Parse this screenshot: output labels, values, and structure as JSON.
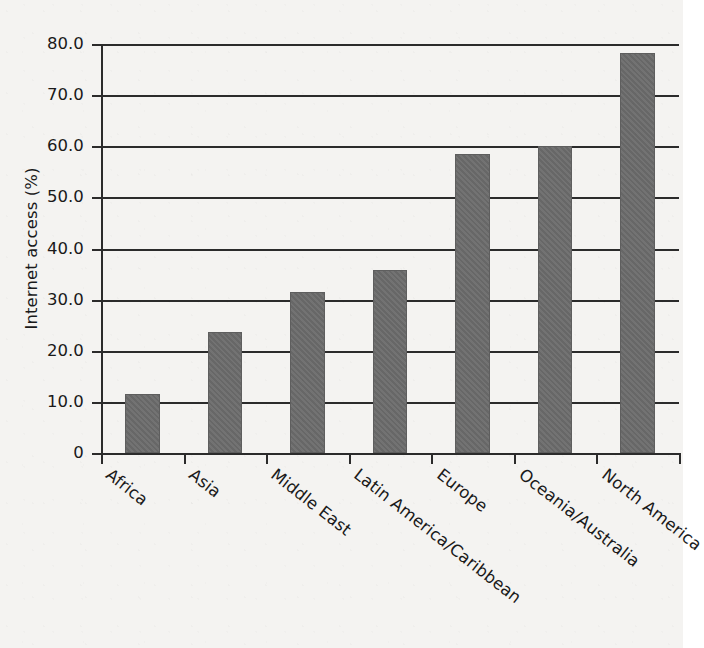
{
  "chart_data": {
    "type": "bar",
    "title": "",
    "xlabel": "",
    "ylabel": "Internet access (%)",
    "categories": [
      "Africa",
      "Asia",
      "Middle East",
      "Latin America/Caribbean",
      "Europe",
      "Oceania/Australia",
      "North America"
    ],
    "values": [
      11.5,
      23.7,
      31.5,
      35.8,
      58.5,
      60.0,
      78.3
    ],
    "ylim": [
      0,
      80
    ],
    "ytick_values": [
      0,
      10,
      20,
      30,
      40,
      50,
      60,
      70,
      80
    ],
    "ytick_labels": [
      "0",
      "10.0",
      "20.0",
      "30.0",
      "40.0",
      "50.0",
      "60.0",
      "70.0",
      "80.0"
    ],
    "grid": "horizontal",
    "legend": "none",
    "bar_color": "#6b6b6b",
    "axis_color": "#2b2b2b",
    "background_color": "#f4f3f1",
    "x_label_rotation_deg": 38
  }
}
